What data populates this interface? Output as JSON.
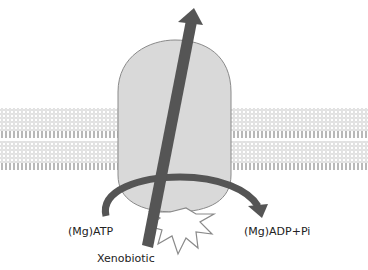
{
  "diagram": {
    "labels": {
      "atp": "(Mg)ATP",
      "adp": "(Mg)ADP+Pi",
      "substrate": "Xenobiotic"
    },
    "elements": {
      "membrane": "lipid bilayer",
      "protein": "transporter",
      "transport_arrow": "xenobiotic efflux direction",
      "hydrolysis_arrow": "ATP hydrolysis",
      "starburst": "energy release"
    },
    "colors": {
      "protein_fill": "#d9d9d9",
      "protein_stroke": "#8a8a8a",
      "arrow_fill": "#555555",
      "membrane_head": "#bfbfbf",
      "membrane_tail": "#a6a6a6",
      "text": "#222222"
    }
  }
}
